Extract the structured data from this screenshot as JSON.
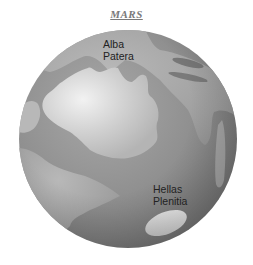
{
  "title": "MARS",
  "labels": {
    "alba_patera": {
      "line1": "Alba",
      "line2": "Patera"
    },
    "hellas_planitia": {
      "line1": "Hellas",
      "line2": "Plenitia"
    }
  },
  "colors": {
    "dark_region": "#7d7d7d",
    "mid_region": "#9a9a9a",
    "light_region": "#d6d6d6",
    "text": "#222222"
  }
}
